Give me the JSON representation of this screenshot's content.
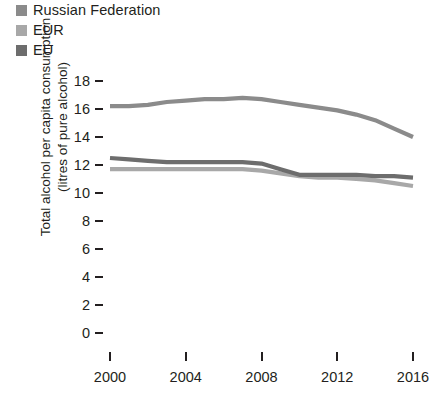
{
  "legend": {
    "position": "top-left",
    "items": [
      {
        "label": "Russian Federation",
        "color": "#8b8b8b",
        "swatch_name": "legend-swatch-russian-federation"
      },
      {
        "label": "EUR",
        "color": "#a8a8a8",
        "swatch_name": "legend-swatch-eur"
      },
      {
        "label": "EU",
        "color": "#6d6d6d",
        "swatch_name": "legend-swatch-eu"
      }
    ]
  },
  "axes": {
    "ylabel": "Total alcohol per capita consumption (litres of pure alcohol)",
    "yticks": [
      "18",
      "16",
      "14",
      "12",
      "10",
      "8",
      "6",
      "4",
      "2",
      "0"
    ],
    "xticks": [
      "2000",
      "2004",
      "2008",
      "2012",
      "2016"
    ],
    "xlabel": ""
  },
  "chart_data": {
    "type": "line",
    "title": "",
    "subtitle": "",
    "xlabel": "",
    "ylabel": "Total alcohol per capita consumption (litres of pure alcohol)",
    "xlim": [
      2000,
      2016
    ],
    "ylim": [
      0,
      18
    ],
    "yticks": [
      0,
      2,
      4,
      6,
      8,
      10,
      12,
      14,
      16,
      18
    ],
    "xticks": [
      2000,
      2004,
      2008,
      2012,
      2016
    ],
    "grid": false,
    "legend_position": "top-left",
    "x": [
      2000,
      2001,
      2002,
      2003,
      2004,
      2005,
      2006,
      2007,
      2008,
      2009,
      2010,
      2011,
      2012,
      2013,
      2014,
      2015,
      2016
    ],
    "series": [
      {
        "name": "Russian Federation",
        "color": "#8b8b8b",
        "values": [
          16.2,
          16.2,
          16.3,
          16.5,
          16.6,
          16.7,
          16.7,
          16.8,
          16.7,
          16.5,
          16.3,
          16.1,
          15.9,
          15.6,
          15.2,
          14.6,
          14.0
        ]
      },
      {
        "name": "EUR",
        "color": "#a8a8a8",
        "values": [
          11.7,
          11.7,
          11.7,
          11.7,
          11.7,
          11.7,
          11.7,
          11.7,
          11.6,
          11.4,
          11.2,
          11.1,
          11.1,
          11.0,
          10.9,
          10.7,
          10.5
        ]
      },
      {
        "name": "EU",
        "color": "#6d6d6d",
        "values": [
          12.5,
          12.4,
          12.3,
          12.2,
          12.2,
          12.2,
          12.2,
          12.2,
          12.1,
          11.7,
          11.3,
          11.3,
          11.3,
          11.3,
          11.2,
          11.2,
          11.1
        ]
      }
    ]
  }
}
